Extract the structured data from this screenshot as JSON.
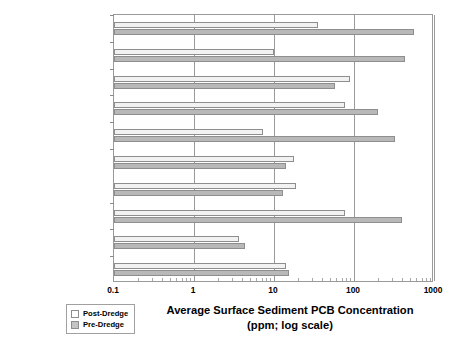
{
  "chart_data": {
    "type": "bar",
    "orientation": "horizontal",
    "title": "",
    "xlabel": "Average Surface Sediment PCB Concentration (ppm; log scale)",
    "xlabel_line1": "Average Surface Sediment PCB Concentration",
    "xlabel_line2": "(ppm; log scale)",
    "ylabel": "",
    "scale": "log",
    "xlim": [
      0.1,
      1000
    ],
    "xticks": [
      0.1,
      1,
      10,
      100,
      1000
    ],
    "xticklabels": [
      "0.1",
      "1",
      "10",
      "100",
      "1000"
    ],
    "grid": true,
    "legend_position": "bottom-left",
    "legend": [
      "Post-Dredge",
      "Pre-Dredge"
    ],
    "categories": [
      "Sheboygan River",
      "St. Lawrence River (GM Massena)",
      "Ruck Pond",
      "New Bedford Pilot Study (Area 1)",
      "New Bedford Pilot Study (Area 2)",
      "Manistique (1993, 1997, 1998, 1999)",
      "Grasse River",
      "Fox River - SMU 56/57 (1999/2000)",
      "Fox River - Deposit N (1998/1999)"
    ],
    "series": [
      {
        "name": "Post-Dredge",
        "values": [
          35,
          10,
          90,
          78,
          7.2,
          19,
          78,
          3.6,
          14
        ]
      },
      {
        "name": "Pre-Dredge",
        "values": [
          560,
          430,
          58,
          200,
          330,
          13,
          400,
          4.3,
          15.5
        ]
      }
    ]
  },
  "categories_display": [
    {
      "line1": "Sheboygan River",
      "line2": ""
    },
    {
      "line1": "St. Lawrence River",
      "line2": "(GM Massena)"
    },
    {
      "line1": "Ruck Pond",
      "line2": ""
    },
    {
      "line1": "New Bedford Pilot Study",
      "line2": "(Area 1)"
    },
    {
      "line1": "New Bedford Pilot Study",
      "line2": "(Area 2)"
    },
    {
      "line1": "Manistique",
      "line2": "(1993, 1997, 1998, 1999)"
    },
    {
      "line1": "Grasse River",
      "line2": ""
    },
    {
      "line1": "Fox River - SMU 56/57",
      "line2": "(1999/2000)"
    },
    {
      "line1": "Fox River - Deposit N",
      "line2": "(1998/1999)"
    }
  ],
  "legend": {
    "post_label": "Post-Dredge",
    "pre_label": "Pre-Dredge"
  },
  "colors": {
    "post_dredge": "#f2f2f2",
    "pre_dredge": "#b8b8b8",
    "frame": "#9a9a9a",
    "text": "#000000",
    "background": "#ffffff"
  }
}
